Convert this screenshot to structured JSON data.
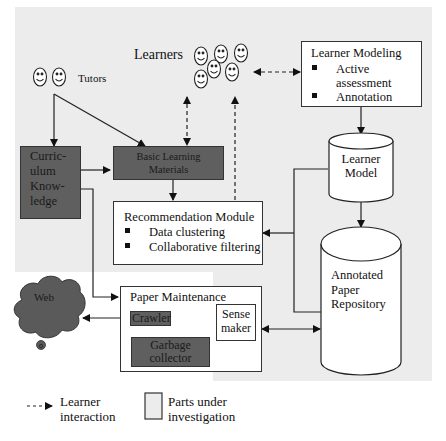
{
  "colors": {
    "investigation_region": "#ececec",
    "dark_box": "#5f5f5f",
    "line": "#222222",
    "cloud": "#5a5a5a"
  },
  "actors": {
    "tutors_label": "Tutors",
    "learners_label": "Learners"
  },
  "boxes": {
    "curriculum_knowledge": [
      "Curric-",
      "ulum",
      "Know-",
      "ledge"
    ],
    "basic_learning_materials": [
      "Basic Learning",
      "Materials"
    ],
    "learner_modeling": {
      "title": "Learner Modeling",
      "items": [
        "Active assessment",
        "Annotation"
      ],
      "item_lines": [
        [
          "Active",
          "assessment"
        ],
        [
          "Annotation"
        ]
      ]
    },
    "recommendation_module": {
      "title": "Recommendation Module",
      "items": [
        "Data clustering",
        "Collaborative filtering"
      ]
    },
    "paper_maintenance": {
      "title": "Paper Maintenance",
      "crawler": "Crawler",
      "garbage_collector": [
        "Garbage",
        "collector"
      ],
      "sense_maker": [
        "Sense",
        "maker"
      ]
    }
  },
  "databases": {
    "learner_model": [
      "Learner",
      "Model"
    ],
    "annotated_paper_repository": [
      "Annotated",
      "Paper",
      "Repository"
    ]
  },
  "external": {
    "web": "Web"
  },
  "legend": {
    "learner_interaction": [
      "Learner",
      "interaction"
    ],
    "parts_under_investigation": [
      "Parts under",
      "investigation"
    ]
  }
}
